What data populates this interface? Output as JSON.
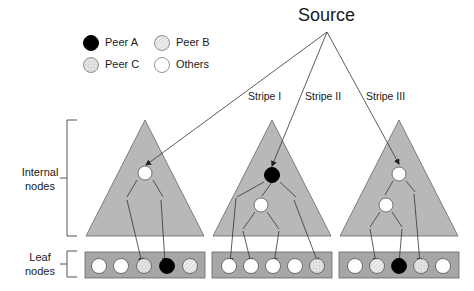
{
  "source": {
    "label": "Source"
  },
  "legend": [
    {
      "label": "Peer A",
      "fill": "peerA"
    },
    {
      "label": "Peer B",
      "fill": "peerB"
    },
    {
      "label": "Peer C",
      "fill": "peerC"
    },
    {
      "label": "Others",
      "fill": "other"
    }
  ],
  "stripes": [
    {
      "label": "Stripe I",
      "internal_nodes": [
        "other"
      ],
      "leaves": [
        "other",
        "other",
        "peerC",
        "peerA",
        "peerB"
      ]
    },
    {
      "label": "Stripe II",
      "internal_nodes": [
        "peerA",
        "other"
      ],
      "leaves": [
        "other",
        "other",
        "other",
        "other",
        "peerC"
      ]
    },
    {
      "label": "Stripe III",
      "internal_nodes": [
        "other",
        "other"
      ],
      "leaves": [
        "other",
        "peerB",
        "peerA",
        "peerC",
        "other"
      ]
    }
  ],
  "side_labels": {
    "internal": {
      "line1": "Internal",
      "line2": "nodes"
    },
    "leaf": {
      "line1": "Leaf",
      "line2": "nodes"
    }
  },
  "colors": {
    "triangle_fill": "#b8b8b8",
    "leaf_bar_fill": "#a6a6a6",
    "peerA": "#000000",
    "peerB": "#e6e6e6",
    "peerC": "#dcdcdc",
    "other": "#ffffff",
    "line": "#333333"
  }
}
